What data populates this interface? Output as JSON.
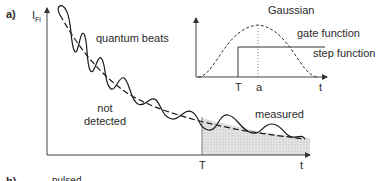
{
  "panel_a": {
    "label": "a)",
    "y_axis_label": "I",
    "y_axis_subscript": "Fl",
    "curve_labels": {
      "quantum_beats": "quantum beats",
      "not_detected_line1": "not",
      "not_detected_line2": "detected",
      "measured": "measured"
    },
    "x_axis_ticks": {
      "T": "T",
      "t": "t"
    },
    "inset": {
      "title": "Gaussian",
      "gate_function": "gate function",
      "step_function": "step function",
      "ticks": {
        "T": "T",
        "a": "a",
        "t": "t"
      }
    }
  },
  "panel_b": {
    "label": "b)",
    "text": "pulsed"
  },
  "colors": {
    "line": "#1a1a1a",
    "axis": "#555555",
    "shade": "#d9d9d9"
  }
}
